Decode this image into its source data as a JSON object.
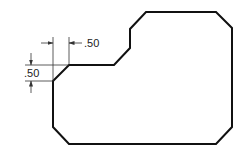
{
  "diagram": {
    "type": "technical-drawing",
    "colors": {
      "outline": "#111111",
      "dimension": "#333333",
      "background": "#ffffff"
    },
    "outline_points": "53,81 69,65 114,65 130,48 130,29 146,12 216,12 232,28 232,127 216,144 69,144 53,127",
    "dimensions": {
      "horizontal_chamfer": {
        "label": ".50"
      },
      "vertical_chamfer": {
        "label": ".50"
      }
    }
  }
}
